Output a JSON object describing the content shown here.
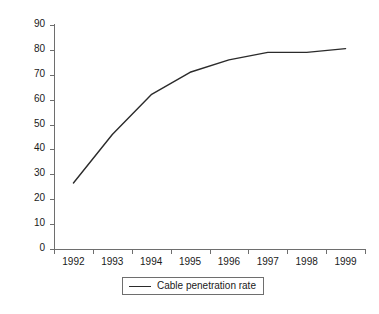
{
  "chart_data": {
    "type": "line",
    "title": "",
    "subtitle": "",
    "xlabel": "",
    "ylabel": "",
    "categories": [
      "1992",
      "1993",
      "1994",
      "1995",
      "1996",
      "1997",
      "1998",
      "1999"
    ],
    "x": [
      1992,
      1993,
      1994,
      1995,
      1996,
      1997,
      1998,
      1999
    ],
    "series": [
      {
        "name": "Cable penetration rate",
        "values": [
          26.5,
          46,
          62,
          71,
          76,
          79,
          79,
          80.5
        ],
        "color": "#2b2b2b"
      }
    ],
    "ylim": [
      0,
      90
    ],
    "ytick_values": [
      0,
      10,
      20,
      30,
      40,
      50,
      60,
      70,
      80,
      90
    ],
    "ytick_labels": [
      "0",
      "10",
      "20",
      "30",
      "40",
      "50",
      "60",
      "70",
      "80",
      "90"
    ],
    "xtick_labels": [
      "1992",
      "1993",
      "1994",
      "1995",
      "1996",
      "1997",
      "1998",
      "1999"
    ],
    "grid": false,
    "legend_position": "bottom-center",
    "legend_entries": [
      "Cable penetration rate"
    ],
    "axis_color": "#6e6e6e",
    "background": "#ffffff"
  },
  "legend": {
    "label": "Cable penetration rate"
  }
}
